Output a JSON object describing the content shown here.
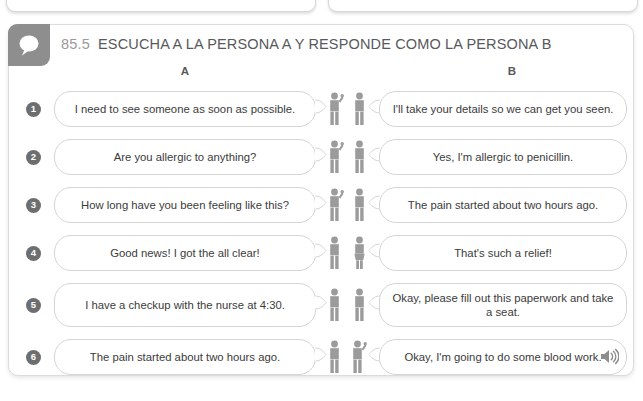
{
  "top_cards": [
    {
      "name": "partial-card-left"
    },
    {
      "name": "partial-card-right"
    }
  ],
  "header": {
    "badge_icon": "speech-bubble-icon",
    "exercise_number": "85.5",
    "title": "ESCUCHA A LA PERSONA A Y RESPONDE COMO LA PERSONA B"
  },
  "columns": {
    "a_label": "A",
    "b_label": "B"
  },
  "rows": [
    {
      "number": "1",
      "a_text": "I need to see someone as soon as possible.",
      "b_text": "I'll take your details so we can get you seen.",
      "tall": false
    },
    {
      "number": "2",
      "a_text": "Are you allergic to anything?",
      "b_text": "Yes, I'm allergic to penicillin.",
      "tall": false
    },
    {
      "number": "3",
      "a_text": "How long have you been feeling like this?",
      "b_text": "The pain started about two hours ago.",
      "tall": false
    },
    {
      "number": "4",
      "a_text": "Good news! I got the all clear!",
      "b_text": "That's such a relief!",
      "tall": false
    },
    {
      "number": "5",
      "a_text": "I have a checkup with the nurse at 4:30.",
      "b_text": "Okay, please fill out this paperwork and take a seat.",
      "tall": true
    },
    {
      "number": "6",
      "a_text": "The pain started about two hours ago.",
      "b_text": "Okay, I'm going to do some blood work.",
      "tall": false
    }
  ],
  "footer": {
    "audio_icon": "speaker-icon"
  },
  "colors": {
    "badge_gray": "#8e8e8e",
    "number_circle": "#6d6e70",
    "title_text": "#58595b",
    "number_text": "#9a9a9a",
    "bubble_border": "#d5d5d5",
    "figure_gray": "#9b9b9b"
  }
}
